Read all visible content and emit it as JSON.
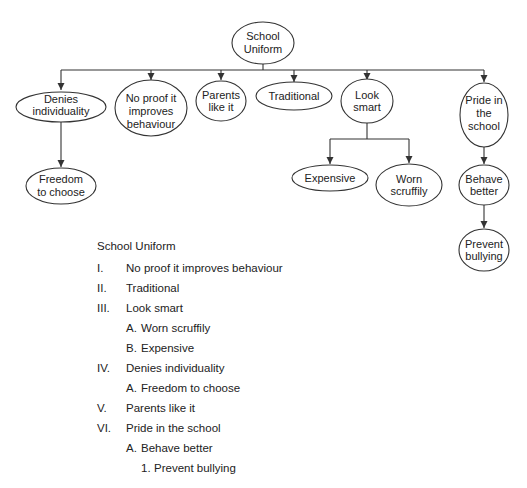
{
  "diagram": {
    "root": {
      "id": "school-uniform",
      "lines": [
        "School",
        "Uniform"
      ]
    },
    "nodes": {
      "denies_individuality": {
        "lines": [
          "Denies",
          "individuality"
        ]
      },
      "no_proof": {
        "lines": [
          "No proof it",
          "improves",
          "behaviour"
        ]
      },
      "parents_like_it": {
        "lines": [
          "Parents",
          "like it"
        ]
      },
      "traditional": {
        "lines": [
          "Traditional"
        ]
      },
      "look_smart": {
        "lines": [
          "Look",
          "smart"
        ]
      },
      "pride_in_school": {
        "lines": [
          "Pride in",
          "the",
          "school"
        ]
      },
      "freedom_to_choose": {
        "lines": [
          "Freedom",
          "to choose"
        ]
      },
      "expensive": {
        "lines": [
          "Expensive"
        ]
      },
      "worn_scruffily": {
        "lines": [
          "Worn",
          "scruffily"
        ]
      },
      "behave_better": {
        "lines": [
          "Behave",
          "better"
        ]
      },
      "prevent_bullying": {
        "lines": [
          "Prevent",
          "bullying"
        ]
      }
    },
    "edges": [
      [
        "School Uniform",
        "Denies individuality"
      ],
      [
        "School Uniform",
        "No proof it improves behaviour"
      ],
      [
        "School Uniform",
        "Parents like it"
      ],
      [
        "School Uniform",
        "Traditional"
      ],
      [
        "School Uniform",
        "Look smart"
      ],
      [
        "School Uniform",
        "Pride in the school"
      ],
      [
        "Denies individuality",
        "Freedom to choose"
      ],
      [
        "Look smart",
        "Expensive"
      ],
      [
        "Look smart",
        "Worn scruffily"
      ],
      [
        "Pride in the school",
        "Behave better"
      ],
      [
        "Behave better",
        "Prevent bullying"
      ]
    ]
  },
  "outline": {
    "title": "School Uniform",
    "items": [
      {
        "num": "I.",
        "label": "No proof it improves behaviour",
        "level": 1
      },
      {
        "num": "II.",
        "label": "Traditional",
        "level": 1
      },
      {
        "num": "III.",
        "label": "Look smart",
        "level": 1
      },
      {
        "num": "A.",
        "label": "Worn scruffily",
        "level": 2
      },
      {
        "num": "B.",
        "label": "Expensive",
        "level": 2
      },
      {
        "num": "IV.",
        "label": "Denies individuality",
        "level": 1
      },
      {
        "num": "A.",
        "label": "Freedom to choose",
        "level": 2
      },
      {
        "num": "V.",
        "label": "Parents like it",
        "level": 1
      },
      {
        "num": "VI.",
        "label": "Pride in the school",
        "level": 1
      },
      {
        "num": "A.",
        "label": "Behave better",
        "level": 2
      },
      {
        "num": "1.",
        "label": "Prevent bullying",
        "level": 3
      }
    ]
  },
  "colors": {
    "stroke": "#333333",
    "text": "#222222",
    "background": "#ffffff"
  }
}
